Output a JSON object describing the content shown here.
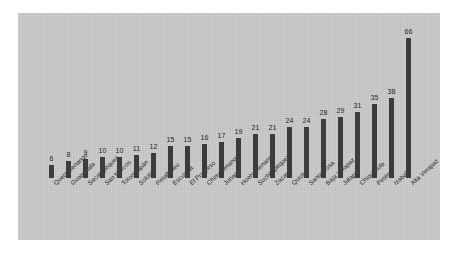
{
  "chart_data": {
    "type": "bar",
    "title": "",
    "subtitle": "",
    "xlabel": "",
    "ylabel": "",
    "grid": false,
    "legend": "none",
    "orientation": "vertical",
    "sorted": "ascending",
    "ylim": [
      0,
      70
    ],
    "categories": [
      "Quetzaltenango",
      "Guatemala",
      "Sacatepéquez",
      "San Marcos",
      "Totonicapán",
      "Sololá",
      "Retalhuleu",
      "Escuintla",
      "El Progreso",
      "Chimaltenango",
      "Jutiapa",
      "Huehuetenango",
      "Suchitepéquez",
      "Zacapa",
      "Quiché",
      "Santa Rosa",
      "Baja Verapaz",
      "Jalapa",
      "Chiquimula",
      "Petén",
      "Izabal",
      "Alta Verapaz"
    ],
    "values": [
      6,
      8,
      9,
      10,
      10,
      11,
      12,
      15,
      15,
      16,
      17,
      19,
      21,
      21,
      24,
      24,
      28,
      29,
      31,
      35,
      38,
      66
    ],
    "value_labels": [
      "6",
      "8",
      "9",
      "10",
      "10",
      "11",
      "12",
      "15",
      "15",
      "16",
      "17",
      "19",
      "21",
      "21",
      "24",
      "24",
      "28",
      "29",
      "31",
      "35",
      "38",
      "66"
    ],
    "colors": {
      "bar": "#3c3c3c",
      "panel_background": "#c9c9c9",
      "page_background": "#ffffff",
      "label_text": "#1f1f1f"
    }
  }
}
